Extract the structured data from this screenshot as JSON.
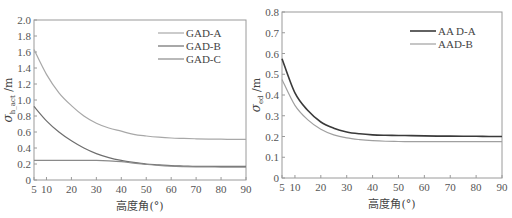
{
  "chart_data": [
    {
      "type": "line",
      "title": "",
      "xlabel": "高度角(°)",
      "ylabel": "σ_h_act /m",
      "xlim": [
        5,
        90
      ],
      "ylim": [
        0,
        2.0
      ],
      "xticks": [
        5,
        10,
        20,
        30,
        40,
        50,
        60,
        70,
        80,
        90
      ],
      "yticks": [
        0,
        0.2,
        0.4,
        0.6,
        0.8,
        1.0,
        1.2,
        1.4,
        1.6,
        1.8,
        2.0
      ],
      "ytick_labels": [
        "0",
        "0.2",
        "0.4",
        "0.6",
        "0.8",
        "1.0",
        "1.2",
        "1.4",
        "1.6",
        "1.8",
        "2.0"
      ],
      "grid": false,
      "legend_position": "upper right",
      "x": [
        5,
        10,
        15,
        20,
        25,
        30,
        35,
        40,
        45,
        50,
        55,
        60,
        65,
        70,
        75,
        80,
        85,
        90
      ],
      "series": [
        {
          "name": "GAD-A",
          "color": "#a8a8a8",
          "values": [
            1.63,
            1.32,
            1.09,
            0.93,
            0.8,
            0.71,
            0.65,
            0.61,
            0.57,
            0.55,
            0.535,
            0.525,
            0.52,
            0.515,
            0.512,
            0.51,
            0.508,
            0.507
          ]
        },
        {
          "name": "GAD-B",
          "color": "#6e6e6e",
          "values": [
            0.92,
            0.74,
            0.6,
            0.49,
            0.4,
            0.33,
            0.28,
            0.245,
            0.22,
            0.2,
            0.19,
            0.18,
            0.175,
            0.17,
            0.17,
            0.17,
            0.17,
            0.17
          ]
        },
        {
          "name": "GAD-C",
          "color": "#8a8a8a",
          "values": [
            0.245,
            0.245,
            0.245,
            0.245,
            0.245,
            0.245,
            0.24,
            0.23,
            0.21,
            0.195,
            0.182,
            0.173,
            0.168,
            0.165,
            0.163,
            0.162,
            0.162,
            0.162
          ]
        }
      ]
    },
    {
      "type": "line",
      "title": "",
      "xlabel": "高度角(°)",
      "ylabel": "σ_ed /m",
      "xlim": [
        5,
        90
      ],
      "ylim": [
        0,
        0.8
      ],
      "xticks": [
        5,
        10,
        20,
        30,
        40,
        50,
        60,
        70,
        80,
        90
      ],
      "yticks": [
        0,
        0.1,
        0.2,
        0.3,
        0.4,
        0.5,
        0.6,
        0.7,
        0.8
      ],
      "ytick_labels": [
        "0",
        "0.1",
        "0.2",
        "0.3",
        "0.4",
        "0.5",
        "0.6",
        "0.7",
        "0.8"
      ],
      "grid": false,
      "legend_position": "upper right",
      "x": [
        5,
        10,
        15,
        20,
        25,
        30,
        35,
        40,
        45,
        50,
        55,
        60,
        65,
        70,
        75,
        80,
        85,
        90
      ],
      "series": [
        {
          "name": "AA D-A",
          "color": "#3a3a3a",
          "values": [
            0.575,
            0.41,
            0.325,
            0.27,
            0.24,
            0.222,
            0.213,
            0.208,
            0.206,
            0.205,
            0.204,
            0.203,
            0.202,
            0.202,
            0.201,
            0.201,
            0.2,
            0.2
          ]
        },
        {
          "name": "AAD-B",
          "color": "#a0a0a0",
          "values": [
            0.475,
            0.35,
            0.28,
            0.235,
            0.208,
            0.193,
            0.185,
            0.18,
            0.177,
            0.176,
            0.175,
            0.175,
            0.175,
            0.175,
            0.175,
            0.175,
            0.175,
            0.175
          ]
        }
      ]
    }
  ],
  "charts": [
    {
      "frame": {
        "x0": 34,
        "x1": 246,
        "y0": 20,
        "y1": 180
      },
      "ylabel_main": "σ",
      "ylabel_sub": "h_act",
      "ylabel_unit": " /m",
      "xlabel": "高度角(°)",
      "legend": {
        "x": 160,
        "y": 33,
        "gap": 13
      }
    },
    {
      "frame": {
        "x0": 282,
        "x1": 502,
        "y0": 12,
        "y1": 178
      },
      "ylabel_main": "σ",
      "ylabel_sub": "ed",
      "ylabel_unit": " /m",
      "xlabel": "高度角(°)",
      "legend": {
        "x": 412,
        "y": 31,
        "gap": 13
      }
    }
  ]
}
